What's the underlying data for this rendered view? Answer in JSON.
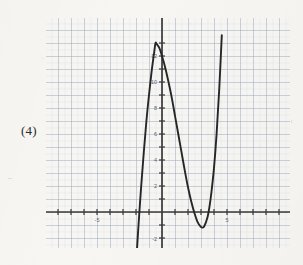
{
  "problem": {
    "label": "(4)"
  },
  "colors": {
    "paper": "#f7f6f3",
    "minor_grid": "#cfd6e4",
    "major_grid": "#9aa4b8",
    "axis": "#3a3a3a",
    "curve": "#262626",
    "tick_text": "#5a5f73",
    "label_text": "#2c2c2c"
  },
  "chart_data": {
    "type": "line",
    "title": "",
    "subtitle": "",
    "xlabel": "",
    "ylabel": "",
    "xlim": [
      -9,
      10
    ],
    "ylim": [
      -3.5,
      14.5
    ],
    "grid": true,
    "minor_grid_step": 0.5,
    "major_grid_step": 1,
    "legend": false,
    "legend_position": "none",
    "x_tick_labels": [
      "-5",
      "5"
    ],
    "x_tick_values": [
      -5,
      5
    ],
    "y_tick_labels": [
      "12",
      "10",
      "8",
      "6",
      "4",
      "2",
      "-2"
    ],
    "y_tick_values": [
      12,
      10,
      8,
      6,
      4,
      2,
      -2
    ],
    "annotations": [],
    "series": [
      {
        "name": "cubic",
        "description": "cubic polynomial with local maximum near (-0.5, 13) and local minimum near (3.1, -1.2)",
        "local_max": [
          -0.5,
          13
        ],
        "local_min": [
          3.1,
          -1.2
        ],
        "x_intercepts": [
          -1.85,
          2.6,
          3.6
        ],
        "y_intercept": 12,
        "x": [
          -1.95,
          -1.8,
          -1.6,
          -1.4,
          -1.2,
          -1.0,
          -0.8,
          -0.6,
          -0.5,
          -0.4,
          -0.2,
          0.0,
          0.25,
          0.5,
          0.75,
          1.0,
          1.25,
          1.5,
          1.75,
          2.0,
          2.25,
          2.5,
          2.75,
          3.0,
          3.1,
          3.25,
          3.5,
          3.65,
          3.8,
          4.0,
          4.2,
          4.4,
          4.6
        ],
        "y": [
          -3.3,
          -0.9,
          2.0,
          4.6,
          7.0,
          9.0,
          10.8,
          12.3,
          13.0,
          12.9,
          12.6,
          12.0,
          11.1,
          10.0,
          8.8,
          7.4,
          6.0,
          4.6,
          3.2,
          1.9,
          0.8,
          -0.1,
          -0.8,
          -1.15,
          -1.2,
          -1.1,
          -0.4,
          0.4,
          1.5,
          3.4,
          6.0,
          9.4,
          13.6
        ]
      }
    ]
  }
}
